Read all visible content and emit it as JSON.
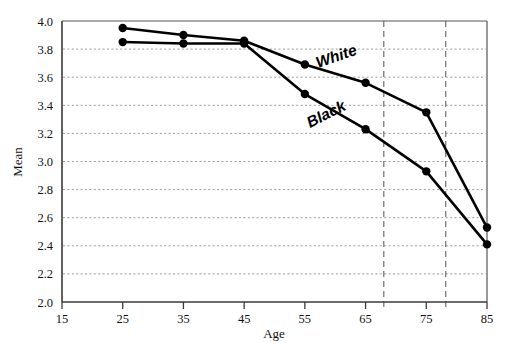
{
  "chart_data": {
    "type": "line",
    "title": "",
    "xlabel": "Age",
    "ylabel": "Mean",
    "x": [
      25,
      35,
      45,
      55,
      65,
      75,
      85
    ],
    "xlim": [
      15,
      85
    ],
    "ylim": [
      2.0,
      4.0
    ],
    "xticks": [
      15,
      25,
      35,
      45,
      55,
      65,
      75,
      85
    ],
    "xticklabels": [
      "15",
      "25",
      "35",
      "45",
      "55",
      "65",
      "75",
      "85"
    ],
    "yticks": [
      2.0,
      2.2,
      2.4,
      2.6,
      2.8,
      3.0,
      3.2,
      3.4,
      3.6,
      3.8,
      4.0
    ],
    "yticklabels": [
      "2.0",
      "2.2",
      "2.4",
      "2.6",
      "2.8",
      "3.0",
      "3.2",
      "3.4",
      "3.6",
      "3.8",
      "4.0"
    ],
    "grid": "horizontal-dotted",
    "legend": "inline-labels",
    "series": [
      {
        "name": "White",
        "label": "White",
        "color": "#000000",
        "marker": "filled-circle",
        "values": [
          3.95,
          3.9,
          3.86,
          3.69,
          3.56,
          3.35,
          2.53
        ]
      },
      {
        "name": "Black",
        "label": "Black",
        "color": "#000000",
        "marker": "filled-circle",
        "values": [
          3.85,
          3.84,
          3.84,
          3.48,
          3.23,
          2.93,
          2.41
        ]
      }
    ],
    "annotations": [
      {
        "name": "reference-line-1",
        "type": "vline",
        "x": 68.0,
        "style": "dashed"
      },
      {
        "name": "reference-line-2",
        "type": "vline",
        "x": 78.2,
        "style": "dashed"
      }
    ]
  },
  "axes": {
    "x_title": "Age",
    "y_title": "Mean"
  }
}
